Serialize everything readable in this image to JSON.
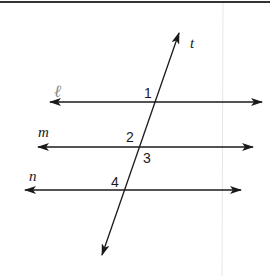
{
  "diagram": {
    "type": "parallel lines cut by a transversal",
    "colors": {
      "line": "#1a1a1a",
      "frame": "#333333",
      "faint_rule": "#e6e6e6",
      "script_label": "#8a8a8a"
    },
    "lines": {
      "l": {
        "label": "ℓ",
        "y": 102,
        "x1": 50,
        "x2": 262
      },
      "m": {
        "label": "m",
        "y": 147,
        "x1": 38,
        "x2": 253
      },
      "n": {
        "label": "n",
        "y": 190,
        "x1": 25,
        "x2": 241
      }
    },
    "transversal": {
      "label": "t",
      "x1": 179,
      "y1": 33,
      "x2": 102,
      "y2": 255
    },
    "angles": [
      {
        "id": "1",
        "label": "1"
      },
      {
        "id": "2",
        "label": "2"
      },
      {
        "id": "3",
        "label": "3"
      },
      {
        "id": "4",
        "label": "4"
      }
    ]
  }
}
